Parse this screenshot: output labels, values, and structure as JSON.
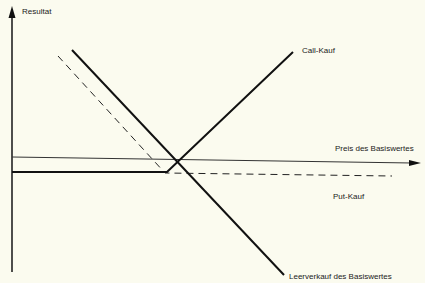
{
  "diagram": {
    "y_axis_label": "Resultat",
    "x_axis_label": "Preis des Basiswertes",
    "series": [
      {
        "name": "Call-Kauf",
        "style": "solid",
        "label": "Call-Kauf"
      },
      {
        "name": "Put-Kauf",
        "style": "dashed",
        "label": "Put-Kauf"
      },
      {
        "name": "Leerverkauf des Basiswertes",
        "style": "solid",
        "label": "Leerverkauf des Basiswertes"
      }
    ],
    "colors": {
      "background": "#fbfbef",
      "line": "#111111"
    }
  }
}
